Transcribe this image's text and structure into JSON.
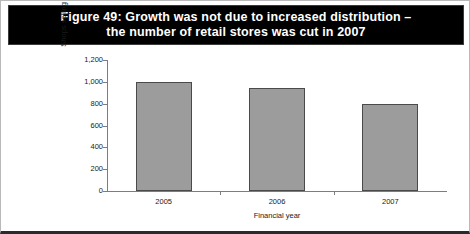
{
  "figure": {
    "title_line_1": "Figure 49: Growth was not due to increased distribution –",
    "title_line_2": "the number of retail stores was cut in 2007",
    "banner_color": "#000000",
    "banner_text_color": "#ffffff",
    "border_color": "#b9b9b9"
  },
  "chart_data": {
    "type": "bar",
    "title": "Figure 49: Growth was not due to increased distribution – the number of retail stores was cut in 2007",
    "categories": [
      "2005",
      "2006",
      "2007"
    ],
    "values": [
      1000,
      940,
      800
    ],
    "series": [
      {
        "name": "Shops selling Radley brand",
        "values": [
          1000,
          940,
          800
        ]
      }
    ],
    "xlabel": "Financial year",
    "ylabel": "Shops selling Radley brand",
    "ylim": [
      0,
      1200
    ],
    "ytick_labels": [
      "1,200",
      "1,000",
      "800",
      "600",
      "400",
      "200",
      "0"
    ],
    "ytick_values": [
      1200,
      1000,
      800,
      600,
      400,
      200,
      0
    ],
    "grid": false,
    "legend": false,
    "bar_color": "#9c9c9c",
    "bar_border_color": "#4a4a4a",
    "axis_color": "#7d7d7d"
  }
}
